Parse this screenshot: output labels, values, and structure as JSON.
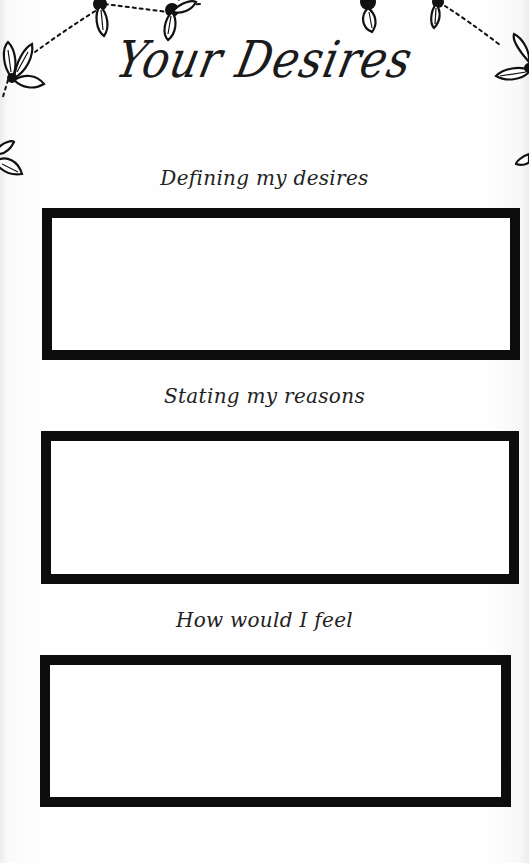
{
  "page": {
    "title": "Your Desires",
    "background": "#fefefe",
    "ink_color": "#0d0d0d"
  },
  "decorations": {
    "top_garland": {
      "description": "hand-drawn leaf clusters connected by dotted strings",
      "icons": [
        "leaf-cluster-icon",
        "leaf-cluster-icon",
        "leaf-cluster-icon",
        "leaf-cluster-icon",
        "leaf-cluster-icon",
        "leaf-cluster-icon",
        "leaf-cluster-icon"
      ]
    }
  },
  "sections": [
    {
      "label": "Defining my desires",
      "value": ""
    },
    {
      "label": "Stating my reasons",
      "value": ""
    },
    {
      "label": "How would I feel",
      "value": ""
    }
  ]
}
